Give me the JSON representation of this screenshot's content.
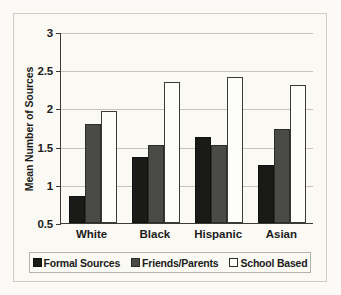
{
  "chart_data": {
    "type": "bar",
    "title": "",
    "xlabel": "",
    "ylabel": "Mean Number of Sources",
    "categories": [
      "White",
      "Black",
      "Hispanic",
      "Asian"
    ],
    "series": [
      {
        "name": "Formal Sources",
        "color": "#1a1a18",
        "values": [
          0.85,
          1.36,
          1.63,
          1.26
        ]
      },
      {
        "name": "Friends/Parents",
        "color": "#4a4a47",
        "values": [
          1.79,
          1.52,
          1.52,
          1.73
        ]
      },
      {
        "name": "School Based",
        "color": "#fdfdf9",
        "values": [
          1.96,
          2.34,
          2.41,
          2.31
        ]
      }
    ],
    "ylim": [
      0.5,
      3
    ],
    "yticks": [
      0.5,
      1,
      1.5,
      2,
      2.5,
      3
    ],
    "ytick_labels": [
      "0.5",
      "1",
      "1.5",
      "2",
      "2.5",
      "3"
    ],
    "grid": true,
    "legend_position": "bottom"
  }
}
